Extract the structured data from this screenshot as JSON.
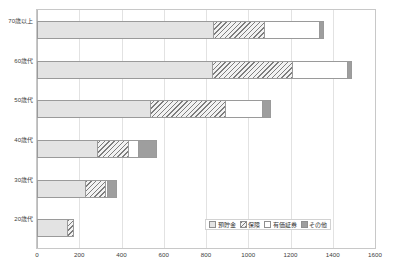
{
  "chart_data": {
    "type": "bar",
    "orientation": "horizontal",
    "stacked": true,
    "title": "",
    "xlabel": "",
    "ylabel": "",
    "xlim": [
      0,
      1600
    ],
    "xticks": [
      0,
      200,
      400,
      600,
      800,
      1000,
      1200,
      1400,
      1600
    ],
    "grid": true,
    "legend_position": "inside-bottom-right",
    "categories": [
      "70歳以上",
      "60歳代",
      "50歳代",
      "40歳代",
      "30歳代",
      "20歳代"
    ],
    "series": [
      {
        "name": "預貯金",
        "pattern": "solid-light-gray",
        "color": "#e3e3e3",
        "values": [
          840,
          835,
          540,
          290,
          230,
          145
        ]
      },
      {
        "name": "保険",
        "pattern": "diagonal-hatch",
        "color": "#7d7d7d",
        "values": [
          245,
          380,
          360,
          150,
          100,
          35
        ]
      },
      {
        "name": "有価証券",
        "pattern": "white",
        "color": "#ffffff",
        "values": [
          265,
          265,
          180,
          50,
          15,
          0
        ]
      },
      {
        "name": "その他",
        "pattern": "solid-dark-gray",
        "color": "#9e9e9e",
        "values": [
          25,
          25,
          40,
          90,
          50,
          0
        ]
      }
    ],
    "totals": [
      1375,
      1505,
      1120,
      580,
      395,
      180
    ]
  },
  "legend": {
    "items": [
      {
        "label": "預貯金",
        "swatch": "deposit"
      },
      {
        "label": "保険",
        "swatch": "insurance"
      },
      {
        "label": "有価証券",
        "swatch": "securities"
      },
      {
        "label": "その他",
        "swatch": "other"
      }
    ]
  },
  "colors": {
    "deposit": "#e3e3e3",
    "insurance": "#7d7d7d",
    "securities": "#ffffff",
    "other": "#9e9e9e",
    "grid": "#e2e2e2",
    "frame": "#c8c8c8",
    "text": "#404040"
  }
}
